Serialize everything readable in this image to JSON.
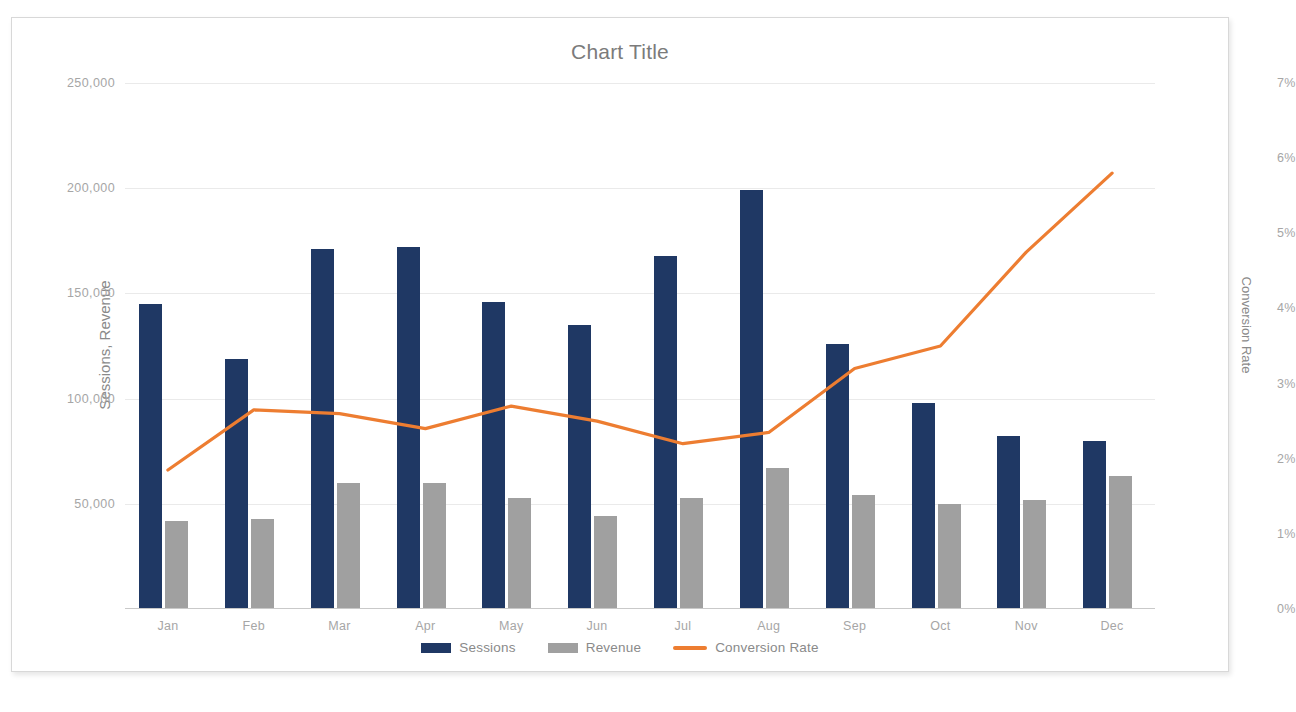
{
  "chart": {
    "title": "Chart Title",
    "frame_border_color": "#d8d8d8",
    "background": "#ffffff"
  },
  "axes": {
    "left": {
      "title": "Sessions, Revenue",
      "ticks": [
        "0",
        "50,000",
        "100,000",
        "150,000",
        "200,000",
        "250,000"
      ],
      "tick_values": [
        0,
        50000,
        100000,
        150000,
        200000,
        250000
      ],
      "min": 0,
      "max": 250000
    },
    "right": {
      "title": "Conversion Rate",
      "ticks": [
        "0%",
        "1%",
        "2%",
        "3%",
        "4%",
        "5%",
        "6%",
        "7%"
      ],
      "tick_values": [
        0,
        1,
        2,
        3,
        4,
        5,
        6,
        7
      ],
      "min": 0,
      "max": 7
    }
  },
  "legend": {
    "position": "bottom",
    "items": [
      {
        "label": "Sessions",
        "color": "#1f3864",
        "marker": "bar"
      },
      {
        "label": "Revenue",
        "color": "#a0a0a0",
        "marker": "bar"
      },
      {
        "label": "Conversion Rate",
        "color": "#ed7d31",
        "marker": "line"
      }
    ]
  },
  "chart_data": {
    "type": "bar",
    "title": "Chart Title",
    "xlabel": "",
    "ylabel": "Sessions, Revenue",
    "y2label": "Conversion Rate",
    "ylim": [
      0,
      250000
    ],
    "y2lim": [
      0,
      7
    ],
    "grid": true,
    "legend_position": "bottom",
    "categories": [
      "Jan",
      "Feb",
      "Mar",
      "Apr",
      "May",
      "Jun",
      "Jul",
      "Aug",
      "Sep",
      "Oct",
      "Nov",
      "Dec"
    ],
    "series": [
      {
        "name": "Sessions",
        "type": "bar",
        "axis": "left",
        "color": "#1f3864",
        "values": [
          145000,
          119000,
          171000,
          172000,
          146000,
          135000,
          168000,
          199000,
          126000,
          98000,
          82000,
          80000
        ]
      },
      {
        "name": "Revenue",
        "type": "bar",
        "axis": "left",
        "color": "#a0a0a0",
        "values": [
          42000,
          43000,
          60000,
          60000,
          53000,
          44000,
          53000,
          67000,
          54000,
          50000,
          52000,
          63000
        ]
      },
      {
        "name": "Conversion Rate",
        "type": "line",
        "axis": "right",
        "color": "#ed7d31",
        "values": [
          1.85,
          2.65,
          2.6,
          2.4,
          2.7,
          2.5,
          2.2,
          2.35,
          3.2,
          3.5,
          4.75,
          5.8
        ]
      }
    ]
  }
}
